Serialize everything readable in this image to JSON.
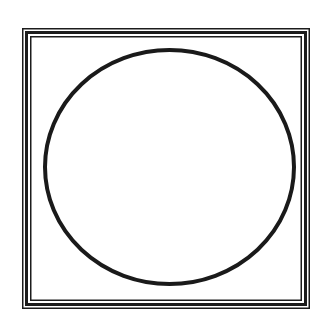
{
  "figure": {
    "background_color": "#ffffff",
    "frame": {
      "style": "triple-line",
      "color": "#1c1c1c",
      "outer": {
        "x": 22.75,
        "y": 28.75,
        "width": 286.5,
        "height": 279.5,
        "stroke_width": 1.5
      },
      "middle": {
        "x": 26.5,
        "y": 32.5,
        "width": 279,
        "height": 272,
        "stroke_width": 3
      },
      "inner": {
        "x": 30.75,
        "y": 36.75,
        "width": 270.5,
        "height": 263.5,
        "stroke_width": 1.5
      }
    },
    "circle": {
      "cx": 169.5,
      "cy": 167,
      "rx": 124.5,
      "ry": 117,
      "stroke_width": 4,
      "color": "#1a1a1a",
      "fill": "none"
    }
  }
}
